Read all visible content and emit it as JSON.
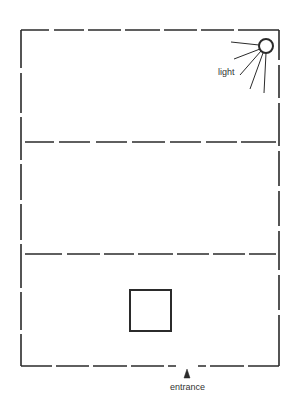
{
  "diagram": {
    "type": "floor-plan",
    "colors": {
      "background": "#ffffff",
      "line": "#2b2b2b",
      "text": "#333333"
    },
    "room": {
      "outline": "dashed",
      "left": 21,
      "top": 30,
      "right": 279,
      "bottom": 366
    },
    "dividers": [
      {
        "y": 142,
        "style": "dashed"
      },
      {
        "y": 254,
        "style": "dashed"
      }
    ],
    "sections": [
      {
        "name": "top-section"
      },
      {
        "name": "middle-section"
      },
      {
        "name": "bottom-section"
      }
    ],
    "object": {
      "shape": "square",
      "x": 130,
      "y": 290,
      "size": 41
    },
    "light": {
      "label": "light",
      "center_x": 266,
      "center_y": 46,
      "radius": 7,
      "ray_count": 5
    },
    "entrance": {
      "label": "entrance",
      "x": 187,
      "marker": "arrow-up"
    }
  }
}
